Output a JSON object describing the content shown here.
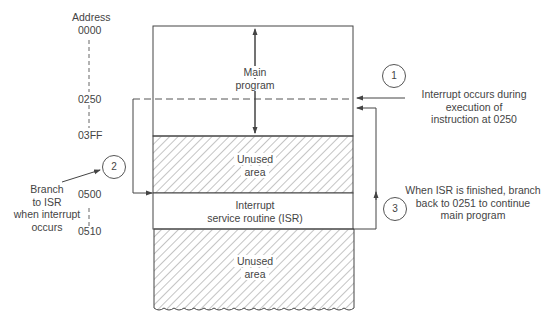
{
  "address_column": {
    "title": "Address",
    "addresses": [
      "0000",
      "0250",
      "03FF",
      "0500",
      "0510"
    ]
  },
  "memory_blocks": [
    {
      "id": "main",
      "label_line1": "Main",
      "label_line2": "program",
      "range": "0000-03FF",
      "fill": "blank"
    },
    {
      "id": "unused-1",
      "label_line1": "Unused",
      "label_line2": "area",
      "range": "03FF-0500",
      "fill": "hatched"
    },
    {
      "id": "isr",
      "label_line1": "Interrupt",
      "label_line2": "service routine (ISR)",
      "range": "0500-0510",
      "fill": "blank"
    },
    {
      "id": "unused-2",
      "label_line1": "Unused",
      "label_line2": "area",
      "range": "0510-",
      "fill": "hatched"
    }
  ],
  "steps": [
    {
      "number": "1",
      "line1": "Interrupt occurs during",
      "line2": "execution of",
      "line3": "instruction at 0250"
    },
    {
      "number": "2",
      "line1": "Branch",
      "line2": "to ISR",
      "line3": "when interrupt",
      "line4": "occurs"
    },
    {
      "number": "3",
      "line1": "When ISR is finished, branch",
      "line2": "back to 0251 to continue",
      "line3": "main program"
    }
  ],
  "colors": {
    "line": "#555555",
    "hatch": "#8a8a8a",
    "background": "#ffffff"
  }
}
